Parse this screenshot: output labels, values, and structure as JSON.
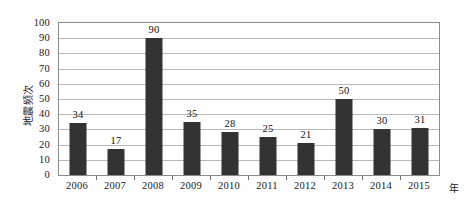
{
  "chart_data": {
    "type": "bar",
    "title": "",
    "subtitle": "",
    "xlabel": "年",
    "ylabel": "地震频次",
    "categories": [
      "2006",
      "2007",
      "2008",
      "2009",
      "2010",
      "2011",
      "2012",
      "2013",
      "2014",
      "2015"
    ],
    "values": [
      34,
      17,
      90,
      35,
      28,
      25,
      21,
      50,
      30,
      31
    ],
    "value_labels": [
      "34",
      "17",
      "90",
      "35",
      "28",
      "25",
      "21",
      "50",
      "30",
      "31"
    ],
    "ylim": [
      0,
      100
    ],
    "ytick_values": [
      0,
      10,
      20,
      30,
      40,
      50,
      60,
      70,
      80,
      90,
      100
    ],
    "ytick_labels": [
      "0",
      "10",
      "20",
      "30",
      "40",
      "50",
      "60",
      "70",
      "80",
      "90",
      "100"
    ],
    "grid": true,
    "grid_axis": "y",
    "legend": false,
    "legend_position": "none",
    "bar_color": "#333333",
    "gridline_color": "#b9b9b9",
    "border_color": "#8b8b8b",
    "background_color": "#ffffff"
  }
}
